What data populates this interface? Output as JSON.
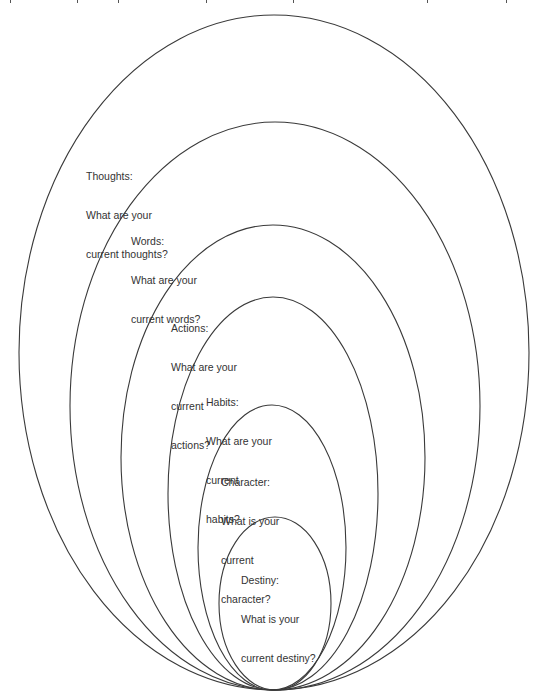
{
  "diagram": {
    "type": "nested-ellipses",
    "stroke_color": "#3a3a3a",
    "text_color": "#333333",
    "rings": [
      {
        "id": "thoughts",
        "title": "Thoughts:",
        "question_lines": [
          "What are your",
          "current thoughts?"
        ]
      },
      {
        "id": "words",
        "title": "Words:",
        "question_lines": [
          "What are your",
          "current words?"
        ]
      },
      {
        "id": "actions",
        "title": "Actions:",
        "question_lines": [
          "What are your",
          "current",
          "actions?"
        ]
      },
      {
        "id": "habits",
        "title": "Habits:",
        "question_lines": [
          "What are your",
          "current",
          "habits?"
        ]
      },
      {
        "id": "character",
        "title": "Character:",
        "question_lines": [
          "What is your",
          "current",
          "character?"
        ]
      },
      {
        "id": "destiny",
        "title": "Destiny:",
        "question_lines": [
          "What is your",
          "current destiny?"
        ]
      }
    ]
  }
}
